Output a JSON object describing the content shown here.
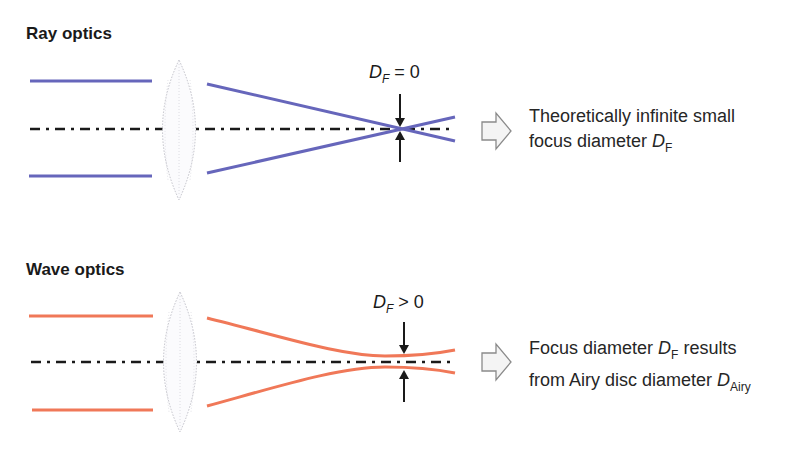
{
  "panels": [
    {
      "id": "ray",
      "title": "Ray optics",
      "beam_color": "#6666bb",
      "focus_label": {
        "symbol": "D",
        "sub": "F",
        "relation": "= 0"
      },
      "caption": {
        "line1": "Theoretically infinite small",
        "line2_prefix": "focus diameter ",
        "line2_symbol": "D",
        "line2_sub": "F"
      }
    },
    {
      "id": "wave",
      "title": "Wave optics",
      "beam_color": "#f07858",
      "focus_label": {
        "symbol": "D",
        "sub": "F",
        "relation": "> 0"
      },
      "caption": {
        "line1_prefix": "Focus diameter ",
        "line1_symbol": "D",
        "line1_sub": "F",
        "line1_suffix": " results",
        "line2_prefix": "from Airy disc diameter ",
        "line2_symbol": "D",
        "line2_sub": "Airy"
      }
    }
  ],
  "colors": {
    "axis": "#1a1a1a",
    "lens_outline": "#b8b8c0",
    "arrow_outline": "#8a8a8a",
    "arrow_fill": "#f4f4f4"
  }
}
